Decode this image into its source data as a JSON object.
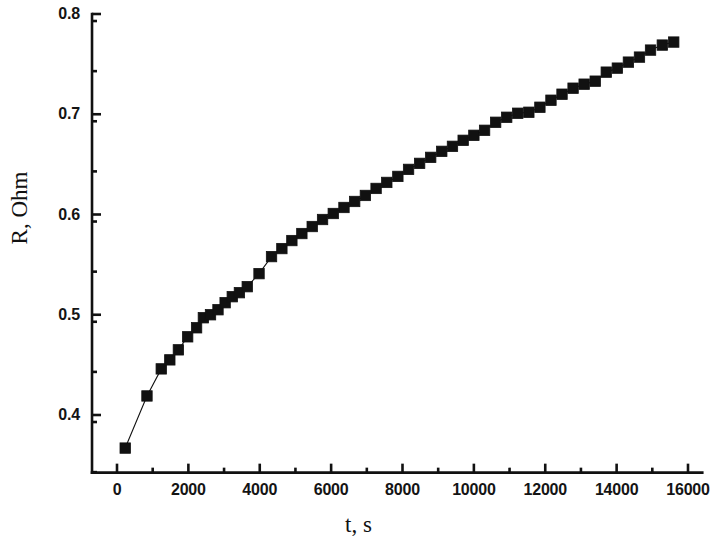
{
  "chart_data": {
    "type": "scatter",
    "title": "",
    "subtitle": "",
    "xlabel": "t, s",
    "ylabel": "R, Ohm",
    "xlim": [
      -700,
      16400
    ],
    "ylim": [
      0.3425,
      0.8
    ],
    "xticks": [
      0,
      2000,
      4000,
      6000,
      8000,
      10000,
      12000,
      14000,
      16000
    ],
    "xtick_labels": [
      "0",
      "2000",
      "4000",
      "6000",
      "8000",
      "10000",
      "12000",
      "14000",
      "16000"
    ],
    "xminor_step": 1000,
    "yticks": [
      0.4,
      0.5,
      0.6,
      0.7,
      0.8
    ],
    "ytick_labels": [
      "0.4",
      "0.5",
      "0.6",
      "0.7",
      "0.8"
    ],
    "yminor_step": 0.05,
    "grid": false,
    "legend": null,
    "marker": "filled-square",
    "marker_color": "#111111",
    "line_color": "#111111",
    "axis_color": "#111111",
    "background": "#ffffff",
    "series": [
      {
        "name": "R(t)",
        "x": [
          230,
          840,
          1240,
          1480,
          1720,
          1980,
          2230,
          2420,
          2620,
          2830,
          3030,
          3230,
          3430,
          3650,
          3980,
          4330,
          4620,
          4900,
          5180,
          5470,
          5760,
          6060,
          6360,
          6660,
          6960,
          7260,
          7560,
          7870,
          8170,
          8480,
          8790,
          9100,
          9400,
          9700,
          10000,
          10300,
          10610,
          10920,
          11230,
          11540,
          11850,
          12160,
          12470,
          12780,
          13090,
          13400,
          13710,
          14020,
          14330,
          14640,
          14950,
          15280,
          15600
        ],
        "y": [
          0.367,
          0.419,
          0.446,
          0.455,
          0.465,
          0.478,
          0.487,
          0.497,
          0.5,
          0.505,
          0.512,
          0.518,
          0.522,
          0.528,
          0.541,
          0.558,
          0.566,
          0.574,
          0.581,
          0.588,
          0.595,
          0.601,
          0.607,
          0.613,
          0.619,
          0.626,
          0.632,
          0.638,
          0.645,
          0.651,
          0.657,
          0.663,
          0.668,
          0.674,
          0.679,
          0.684,
          0.692,
          0.697,
          0.701,
          0.702,
          0.707,
          0.714,
          0.72,
          0.726,
          0.73,
          0.733,
          0.742,
          0.746,
          0.752,
          0.757,
          0.764,
          0.769,
          0.772
        ]
      }
    ]
  }
}
